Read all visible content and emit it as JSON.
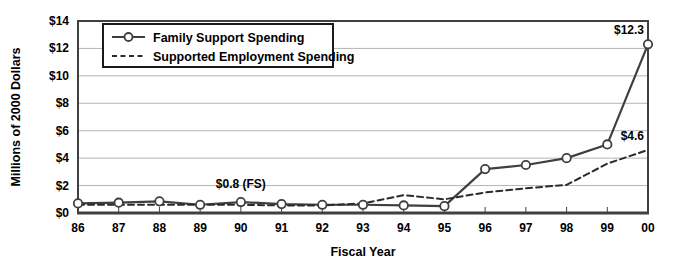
{
  "chart_data": {
    "type": "line",
    "title": "",
    "xlabel": "Fiscal Year",
    "ylabel": "Millions of 2000 Dollars",
    "categories": [
      "86",
      "87",
      "88",
      "89",
      "90",
      "91",
      "92",
      "93",
      "94",
      "95",
      "96",
      "97",
      "98",
      "99",
      "00"
    ],
    "ylim": [
      0,
      14
    ],
    "ytick_labels": [
      "$0",
      "$2",
      "$4",
      "$6",
      "$8",
      "$10",
      "$12",
      "$14"
    ],
    "ytick_values": [
      0,
      2,
      4,
      6,
      8,
      10,
      12,
      14
    ],
    "grid": "horizontal",
    "legend_position": "top-left-inside",
    "series": [
      {
        "name": "Family Support Spending",
        "style": "solid",
        "marker": "open-circle",
        "color": "#3f3f3f",
        "values": [
          0.7,
          0.75,
          0.85,
          0.6,
          0.8,
          0.65,
          0.6,
          0.6,
          0.55,
          0.5,
          3.2,
          3.5,
          4.0,
          5.0,
          12.3
        ]
      },
      {
        "name": "Supported Employment Spending",
        "style": "dashed",
        "marker": "none",
        "color": "#2b2b2b",
        "values": [
          0.6,
          0.6,
          0.6,
          0.6,
          0.6,
          0.55,
          0.55,
          0.7,
          1.3,
          1.0,
          1.5,
          1.8,
          2.05,
          3.6,
          4.6
        ]
      }
    ],
    "annotations": [
      {
        "text": "$0.8 (FS)",
        "category": "90",
        "value": 0.8,
        "anchor": "middle",
        "dx": 0,
        "dy": -14
      },
      {
        "text": "$12.3",
        "category": "00",
        "value": 12.3,
        "anchor": "end",
        "dx": -4,
        "dy": -10
      },
      {
        "text": "$4.6",
        "category": "00",
        "value": 4.6,
        "anchor": "end",
        "dx": -4,
        "dy": -10
      }
    ]
  },
  "colors": {
    "axis": "#404040",
    "grid": "#b5b5b5",
    "plot_background": "#ffffff",
    "legend_border": "#1a1a1a",
    "text": "#000000"
  }
}
